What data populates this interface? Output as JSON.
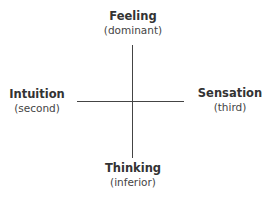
{
  "diagram": {
    "top": {
      "title": "Feeling",
      "subtitle": "(dominant)"
    },
    "left": {
      "title": "Intuition",
      "subtitle": "(second)"
    },
    "right": {
      "title": "Sensation",
      "subtitle": "(third)"
    },
    "bottom": {
      "title": "Thinking",
      "subtitle": "(inferior)"
    }
  }
}
